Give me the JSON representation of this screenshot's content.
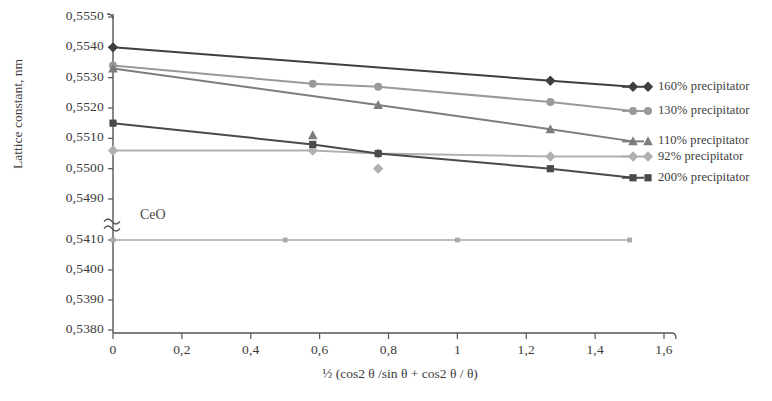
{
  "chart_data": {
    "type": "line",
    "title": "",
    "xlabel": "½ (cos2 θ /sin θ + cos2 θ / θ)",
    "ylabel": "Lattice constant, nm",
    "xlim": [
      0,
      1.6
    ],
    "ylim": [
      0.538,
      0.555
    ],
    "grid": false,
    "legend_position": "right",
    "axis_break": {
      "present": true,
      "between": [
        0.549,
        0.541
      ],
      "symbol": "≈"
    },
    "xticks": [
      "0",
      "0,2",
      "0,4",
      "0,6",
      "0,8",
      "1",
      "1,2",
      "1,4",
      "1,6"
    ],
    "xtick_values": [
      0,
      0.2,
      0.4,
      0.6,
      0.8,
      1.0,
      1.2,
      1.4,
      1.6
    ],
    "yticks": [
      "0,5550",
      "0,5540",
      "0,5530",
      "0,5520",
      "0,5510",
      "0,5500",
      "0,5490",
      "0,5410",
      "0,5400",
      "0,5390",
      "0,5380"
    ],
    "ytick_values": [
      0.555,
      0.554,
      0.553,
      0.552,
      0.551,
      0.55,
      0.549,
      0.541,
      0.54,
      0.539,
      0.538
    ],
    "annotations": [
      {
        "text": "CeO",
        "x": 0.08,
        "y": 0.5414
      }
    ],
    "series": [
      {
        "name": "160% precipitator",
        "legend_label": "160% precipitator",
        "marker": "diamond",
        "color": "#3f3f3f",
        "x": [
          0,
          1.27,
          1.51
        ],
        "y": [
          0.554,
          0.5529,
          0.5527
        ]
      },
      {
        "name": "130% precipitator",
        "legend_label": "130% precipitator",
        "marker": "circle",
        "color": "#9a9a9a",
        "x": [
          0,
          0.58,
          0.77,
          1.27,
          1.51
        ],
        "y": [
          0.5534,
          0.5528,
          0.5527,
          0.5522,
          0.5519
        ]
      },
      {
        "name": "110% precipitator",
        "legend_label": "110% precipitator",
        "marker": "triangle",
        "color": "#7d7d7d",
        "x": [
          0,
          0.77,
          1.27,
          1.51
        ],
        "y": [
          0.5533,
          0.5521,
          0.5513,
          0.5509
        ]
      },
      {
        "name": "92% precipitator",
        "legend_label": "92% precipitator",
        "marker": "diamond",
        "color": "#b0b0b0",
        "x": [
          0,
          0.58,
          0.77,
          1.27,
          1.51
        ],
        "y": [
          0.5506,
          0.5506,
          0.5505,
          0.5504,
          0.5504
        ]
      },
      {
        "name": "200% precipitator",
        "legend_label": "200% precipitator",
        "marker": "square",
        "color": "#4a4a4a",
        "x": [
          0,
          0.58,
          0.77,
          1.27,
          1.51
        ],
        "y": [
          0.5515,
          0.5508,
          0.5505,
          0.55,
          0.5497
        ]
      },
      {
        "name": "CeO",
        "legend_label": "",
        "marker": "square-small",
        "color": "#a8a8a8",
        "x": [
          0,
          0.5,
          1.0,
          1.5
        ],
        "y": [
          0.541,
          0.541,
          0.541,
          0.541
        ]
      }
    ],
    "extra_points": [
      {
        "series": "110% precipitator",
        "x": 0.58,
        "y": 0.5511,
        "marker": "triangle"
      },
      {
        "series": "92% precipitator",
        "x": 0.77,
        "y": 0.55,
        "marker": "diamond"
      }
    ]
  },
  "legend": {
    "items": [
      {
        "label": "160% precipitator"
      },
      {
        "label": "130% precipitator"
      },
      {
        "label": "110% precipitator"
      },
      {
        "label": "92% precipitator"
      },
      {
        "label": "200% precipitator"
      }
    ]
  },
  "axes": {
    "y_title": "Lattice constant, nm",
    "x_title": "½ (cos2 θ /sin θ + cos2 θ / θ)"
  },
  "annotations": {
    "ceo": "CeO"
  },
  "colors": {
    "axis": "#555555",
    "text": "#3b3b3b",
    "s160": "#3f3f3f",
    "s130": "#9a9a9a",
    "s110": "#7d7d7d",
    "s92": "#b0b0b0",
    "s200": "#4a4a4a",
    "ceo": "#a8a8a8"
  }
}
